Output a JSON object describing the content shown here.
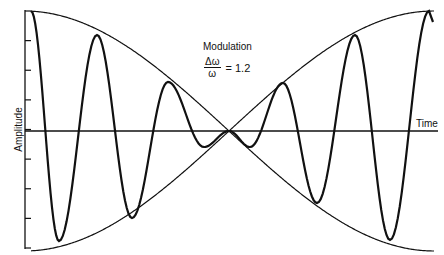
{
  "chart_data": {
    "type": "line",
    "title": "Modulation",
    "annotation": {
      "numerator": "Δω",
      "denominator": "ω",
      "equals": "= 1.2",
      "ratio": 1.2
    },
    "xlabel": "Time",
    "ylabel": "Amplitude",
    "grid": false,
    "y_ticks": 8,
    "series": [
      {
        "name": "modulated carrier",
        "style": "thick",
        "peaks_px": [
          [
            31,
            11
          ],
          [
            97,
            35
          ],
          [
            168,
            82
          ],
          [
            283,
            83
          ],
          [
            355,
            35
          ],
          [
            429,
            11
          ]
        ],
        "troughs_px": [
          [
            59,
            241
          ],
          [
            132,
            218
          ],
          [
            204,
            147
          ],
          [
            250,
            147
          ],
          [
            317,
            203
          ],
          [
            390,
            240
          ]
        ]
      },
      {
        "name": "envelope (+)",
        "style": "thin"
      },
      {
        "name": "envelope (-)",
        "style": "thin"
      }
    ],
    "layout": {
      "x_start": 31,
      "x_end": 434,
      "x_center": 229,
      "y_zero": 131,
      "amplitude": 120,
      "period_px": 72
    }
  },
  "labels": {
    "ylabel": "Amplitude",
    "xlabel": "Time",
    "title": "Modulation",
    "numerator": "Δω",
    "denominator": "ω",
    "equals": "= 1.2"
  }
}
